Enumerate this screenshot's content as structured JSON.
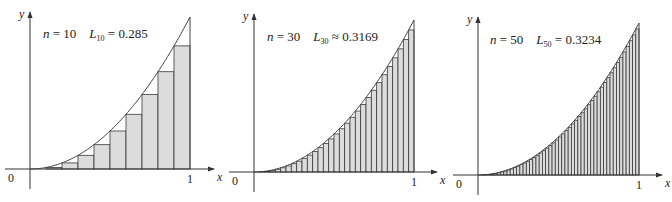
{
  "chart_data": [
    {
      "type": "bar",
      "title": "n = 10  L10 = 0.285",
      "function": "y = x^2",
      "n": 10,
      "approx_symbol": "=",
      "sum_value": "0.285",
      "xlabel": "x",
      "ylabel": "y",
      "x_ticks": [
        "0",
        "1"
      ],
      "xlim": [
        0,
        1
      ],
      "ylim": [
        0,
        1
      ],
      "bar_left_endpoints": [
        0,
        0.1,
        0.2,
        0.3,
        0.4,
        0.5,
        0.6,
        0.7,
        0.8,
        0.9
      ],
      "values": [
        0,
        0.01,
        0.04,
        0.09,
        0.16,
        0.25,
        0.36,
        0.49,
        0.64,
        0.81
      ]
    },
    {
      "type": "bar",
      "title": "n = 30  L30 ≈ 0.3169",
      "function": "y = x^2",
      "n": 30,
      "approx_symbol": "≈",
      "sum_value": "0.3169",
      "xlabel": "x",
      "ylabel": "y",
      "x_ticks": [
        "0",
        "1"
      ],
      "xlim": [
        0,
        1
      ],
      "ylim": [
        0,
        1
      ],
      "values_rule": "left endpoints i/30, height (i/30)^2, i = 0..29"
    },
    {
      "type": "bar",
      "title": "n = 50  L50 = 0.3234",
      "function": "y = x^2",
      "n": 50,
      "approx_symbol": "=",
      "sum_value": "0.3234",
      "xlabel": "x",
      "ylabel": "y",
      "x_ticks": [
        "0",
        "1"
      ],
      "xlim": [
        0,
        1
      ],
      "ylim": [
        0,
        1
      ],
      "values_rule": "left endpoints i/50, height (i/50)^2, i = 0..49"
    }
  ],
  "panels": [
    {
      "n_label": "n = 10",
      "L_sub": "10",
      "rel": "=",
      "value": "0.285",
      "ox": 30,
      "oy": 169,
      "w": 160,
      "h": 152,
      "ytop": 12,
      "xend": 214,
      "tx": 43,
      "ty": 38
    },
    {
      "n_label": "n = 30",
      "L_sub": "30",
      "rel": "≈",
      "value": "0.3169",
      "ox": 254,
      "oy": 172,
      "w": 160,
      "h": 152,
      "ytop": 14,
      "xend": 437,
      "tx": 267,
      "ty": 41
    },
    {
      "n_label": "n = 50",
      "L_sub": "50",
      "rel": "=",
      "value": "0.3234",
      "ox": 478,
      "oy": 175,
      "w": 161,
      "h": 152,
      "ytop": 17,
      "xend": 662,
      "tx": 490,
      "ty": 44
    }
  ],
  "common": {
    "x_label": "x",
    "y_label": "y",
    "origin_label": "0",
    "one_label": "1",
    "L": "L"
  },
  "colors": {
    "bar_fill": "#dcdcdc",
    "bar_stroke": "#3a3a3a",
    "axis": "#333333",
    "curve": "#444444"
  }
}
